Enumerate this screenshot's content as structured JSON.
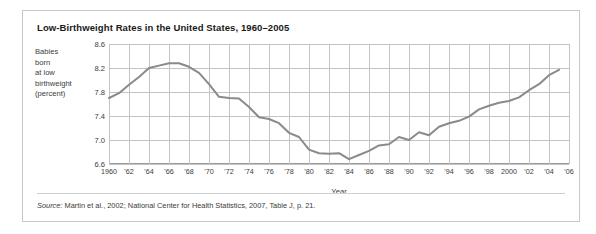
{
  "figure": {
    "title": "Low-Birthweight Rates in the United States, 1960–2005",
    "y_caption_lines": [
      "Babies",
      "born",
      "at low",
      "birthweight",
      "(percent)"
    ],
    "axis_title_x": "Year",
    "source_prefix": "Source:",
    "source_text": " Martin et al., 2002; National Center for Health Statistics, 2007, Table J, p. 21.",
    "line_color": "#8a8a8a",
    "grid_color": "#c4c4c4",
    "axis_color": "#9a9a9a"
  },
  "chart_data": {
    "type": "line",
    "title": "Low-Birthweight Rates in the United States, 1960–2005",
    "xlabel": "Year",
    "ylabel": "Babies born at low birthweight (percent)",
    "xlim": [
      1960,
      2006
    ],
    "ylim": [
      6.6,
      8.6
    ],
    "yticks": [
      6.6,
      7.0,
      7.4,
      7.8,
      8.2,
      8.6
    ],
    "ytick_labels": [
      "6.6",
      "7.0",
      "7.4",
      "7.8",
      "8.2",
      "8.6"
    ],
    "xticks": [
      1960,
      1962,
      1964,
      1966,
      1968,
      1970,
      1972,
      1974,
      1976,
      1978,
      1980,
      1982,
      1984,
      1986,
      1988,
      1990,
      1992,
      1994,
      1996,
      1998,
      2000,
      2002,
      2004,
      2006
    ],
    "xtick_labels": [
      "1960",
      "'62",
      "'64",
      "'66",
      "'68",
      "'70",
      "'72",
      "'74",
      "'76",
      "'78",
      "'80",
      "'82",
      "'84",
      "'86",
      "'88",
      "'90",
      "'92",
      "'94",
      "'96",
      "'98",
      "2000",
      "'02",
      "'04",
      "'06"
    ],
    "grid": true,
    "legend": false,
    "series": [
      {
        "name": "Low-birthweight rate",
        "x": [
          1960,
          1961,
          1962,
          1963,
          1964,
          1965,
          1966,
          1967,
          1968,
          1969,
          1970,
          1971,
          1972,
          1973,
          1974,
          1975,
          1976,
          1977,
          1978,
          1979,
          1980,
          1981,
          1982,
          1983,
          1984,
          1985,
          1986,
          1987,
          1988,
          1989,
          1990,
          1991,
          1992,
          1993,
          1994,
          1995,
          1996,
          1997,
          1998,
          1999,
          2000,
          2001,
          2002,
          2003,
          2004,
          2005
        ],
        "values": [
          7.7,
          7.78,
          7.92,
          8.05,
          8.2,
          8.24,
          8.28,
          8.28,
          8.22,
          8.12,
          7.93,
          7.72,
          7.7,
          7.69,
          7.55,
          7.38,
          7.35,
          7.28,
          7.12,
          7.05,
          6.84,
          6.78,
          6.77,
          6.78,
          6.68,
          6.75,
          6.82,
          6.91,
          6.93,
          7.05,
          7.0,
          7.13,
          7.08,
          7.22,
          7.28,
          7.32,
          7.39,
          7.51,
          7.57,
          7.62,
          7.65,
          7.71,
          7.83,
          7.93,
          8.08,
          8.17
        ]
      }
    ]
  }
}
